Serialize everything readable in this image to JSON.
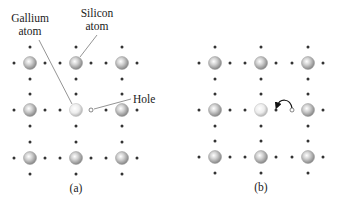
{
  "figure": {
    "panels": [
      {
        "id": "a",
        "caption": "(a)",
        "labels": {
          "gallium_line1": "Gallium",
          "gallium_line2": "atom",
          "silicon_line1": "Silicon",
          "silicon_line2": "atom",
          "hole": "Hole"
        },
        "lattice": "3x3",
        "center_atom": "gallium",
        "hole_position": "right of center atom"
      },
      {
        "id": "b",
        "caption": "(b)",
        "lattice": "3x3",
        "center_atom": "gallium",
        "hole_position": "left of right-middle atom",
        "arrow": "electron moves into hole (curved arrow from hole to adjacent electron)"
      }
    ],
    "colors": {
      "silicon_atom": "#9a9a9a",
      "gallium_atom": "#d8d8d8",
      "electron_dot": "#333333",
      "leader_line": "#555555"
    }
  }
}
